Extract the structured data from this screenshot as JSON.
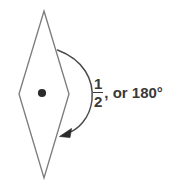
{
  "figure": {
    "shape": {
      "name": "rhombus",
      "outline_color": "#7c7c7c",
      "fill_color": "#ffffff",
      "stroke_width": 1.3,
      "vertices": [
        {
          "x": 44,
          "y": 11
        },
        {
          "x": 69,
          "y": 94
        },
        {
          "x": 44,
          "y": 178
        },
        {
          "x": 19,
          "y": 94
        }
      ]
    },
    "center_point": {
      "x": 42,
      "y": 93,
      "radius": 4,
      "color": "#2b2b2b"
    },
    "rotation_arrow": {
      "color": "#4a4a4a",
      "stroke_width": 1.4,
      "start": {
        "x": 57,
        "y": 50
      },
      "end": {
        "x": 63,
        "y": 134
      },
      "bulge_x": 92,
      "direction": "clockwise-sweep-down",
      "arrowhead": "filled-triangle"
    },
    "label": {
      "numerator": "1",
      "denominator": "2",
      "tail_text": ", or 180°",
      "full_text": "1/2, or 180°",
      "color": "#3a3a3a"
    },
    "background_color": "#ffffff"
  }
}
